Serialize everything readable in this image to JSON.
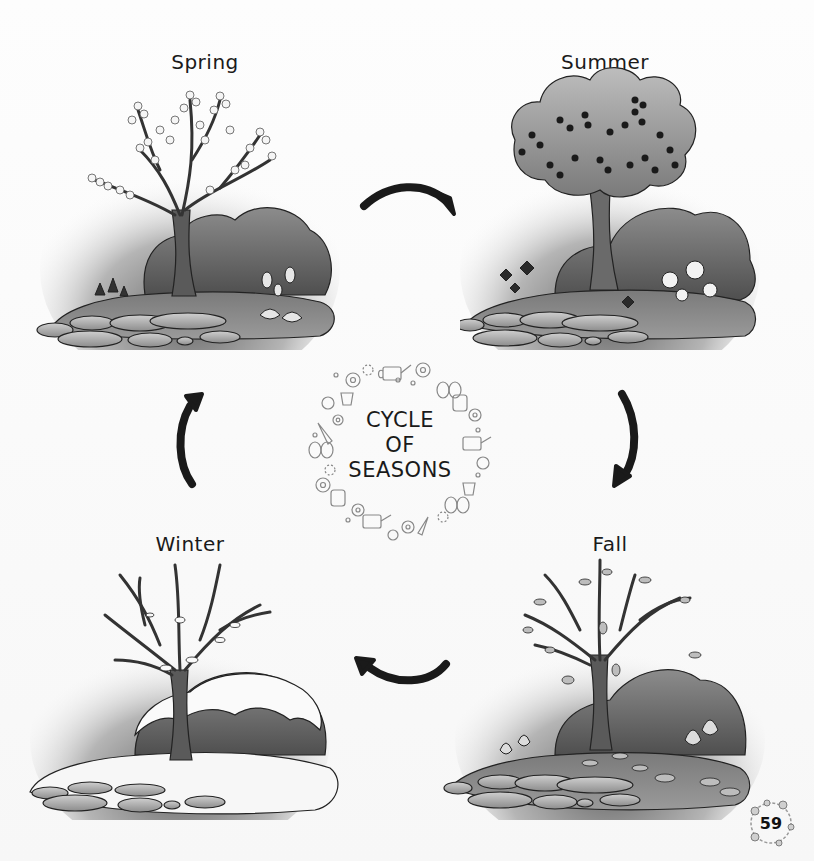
{
  "page": {
    "title": "Cycle of Seasons",
    "page_number": "59"
  },
  "center_badge": {
    "line1": "CYCLE",
    "line2": "OF",
    "line3": "SEASONS",
    "wreath_icons": [
      "flower-icon",
      "watering-can-icon",
      "butterfly-icon",
      "gardening-gloves-icon",
      "ladybug-icon",
      "trowel-icon",
      "flower-pot-icon",
      "dot-icon"
    ]
  },
  "seasons": [
    {
      "id": "spring",
      "label": "Spring",
      "scene": "blossoming tree with bush, tulips and stepping stones"
    },
    {
      "id": "summer",
      "label": "Summer",
      "scene": "leafy fruit tree with bush, flowers and stepping stones"
    },
    {
      "id": "fall",
      "label": "Fall",
      "scene": "tree losing leaves with bush, fallen leaves and stepping stones"
    },
    {
      "id": "winter",
      "label": "Winter",
      "scene": "bare tree with snow-covered bush and snowy ground"
    }
  ],
  "arrows": [
    {
      "from": "spring",
      "to": "summer",
      "direction": "right"
    },
    {
      "from": "summer",
      "to": "fall",
      "direction": "down"
    },
    {
      "from": "fall",
      "to": "winter",
      "direction": "left"
    },
    {
      "from": "winter",
      "to": "spring",
      "direction": "up"
    }
  ],
  "colors": {
    "ink": "#111111",
    "background": "#ffffff",
    "scene_dark": "#4a4a4a",
    "scene_mid": "#8a8a8a",
    "scene_light": "#d6d6d6"
  }
}
